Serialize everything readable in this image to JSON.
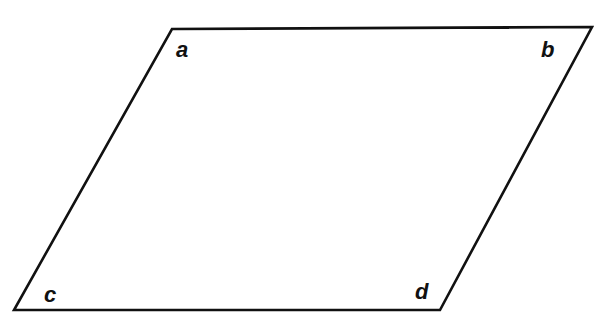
{
  "diagram": {
    "shape": "parallelogram",
    "stroke_color": "#111111",
    "stroke_width": 2.6,
    "vertices": [
      {
        "x": 172,
        "y": 29
      },
      {
        "x": 592,
        "y": 27
      },
      {
        "x": 440,
        "y": 310
      },
      {
        "x": 14,
        "y": 310
      }
    ],
    "labels": [
      {
        "text": "a",
        "x": 176,
        "y": 57
      },
      {
        "text": "b",
        "x": 541,
        "y": 57
      },
      {
        "text": "c",
        "x": 44,
        "y": 302
      },
      {
        "text": "d",
        "x": 415,
        "y": 299
      }
    ]
  }
}
